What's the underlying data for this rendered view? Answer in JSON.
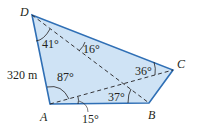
{
  "diagram": {
    "colors": {
      "fill": "#cfe3f5",
      "edge": "#2f6fb5",
      "dashed": "#231f20",
      "text": "#231f20"
    },
    "vertices": {
      "A": {
        "label": "A",
        "x": 50,
        "y": 104
      },
      "B": {
        "label": "B",
        "x": 149,
        "y": 103
      },
      "C": {
        "label": "C",
        "x": 173,
        "y": 70
      },
      "D": {
        "label": "D",
        "x": 32,
        "y": 15
      }
    },
    "side_label": "320 m",
    "angles": {
      "D_ADB": "41°",
      "D_BDC": "16°",
      "C_ACB": "36°",
      "A_DAC": "87°",
      "A_CAB": "15°",
      "B_DBA": "37°"
    }
  }
}
